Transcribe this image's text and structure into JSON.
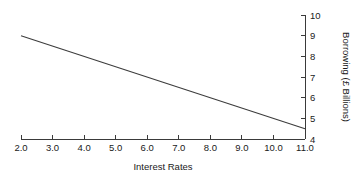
{
  "chart_data": {
    "type": "line",
    "title": "",
    "xlabel": "Interest Rates",
    "ylabel": "Borrowing (£ Billions)",
    "xlim": [
      2.0,
      11.0
    ],
    "ylim": [
      4,
      10
    ],
    "grid": false,
    "legend": false,
    "y_axis_position": "right",
    "x_tick_labels": [
      "2.0",
      "3.0",
      "4.0",
      "5.0",
      "6.0",
      "7.0",
      "8.0",
      "9.0",
      "10.0",
      "11.0"
    ],
    "x_ticks": [
      2.0,
      3.0,
      4.0,
      5.0,
      6.0,
      7.0,
      8.0,
      9.0,
      10.0,
      11.0
    ],
    "y_tick_labels": [
      "4",
      "5",
      "6",
      "7",
      "8",
      "9",
      "10"
    ],
    "y_ticks": [
      4,
      5,
      6,
      7,
      8,
      9,
      10
    ],
    "series": [
      {
        "name": "Borrowing",
        "color": "#3c3c3c",
        "x": [
          2.0,
          11.0
        ],
        "values": [
          9.0,
          4.5
        ]
      }
    ],
    "x": [
      2.0,
      3.0,
      4.0,
      5.0,
      6.0,
      7.0,
      8.0,
      9.0,
      10.0,
      11.0
    ],
    "values": [
      9.0,
      8.5,
      8.0,
      7.5,
      7.0,
      6.5,
      6.0,
      5.5,
      5.0,
      4.5
    ]
  },
  "axis_titles": {
    "x": "Interest Rates",
    "y": "Borrowing (£ Billions)"
  }
}
